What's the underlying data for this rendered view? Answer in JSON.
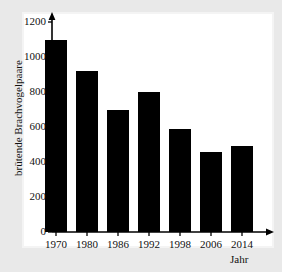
{
  "chart_data": {
    "type": "bar",
    "title": "",
    "subtitle": "",
    "xlabel": "Jahr",
    "ylabel": "brütende Brachvogelpaare",
    "categories": [
      "1970",
      "1980",
      "1986",
      "1992",
      "1998",
      "2006",
      "2014"
    ],
    "values": [
      1100,
      920,
      700,
      800,
      590,
      460,
      490
    ],
    "ylim": [
      0,
      1200
    ],
    "yticks": [
      0,
      200,
      400,
      600,
      800,
      1000,
      1200
    ],
    "ytick_labels": [
      "0",
      "200",
      "400",
      "600",
      "800",
      "1000",
      "1200"
    ],
    "grid": false,
    "legend": false,
    "legend_position": "none",
    "bar_color": "#000000",
    "background_color": "#e9e9e9",
    "panel_color": "#ffffff",
    "axis_color": "#000000",
    "axis_arrows": true
  },
  "axis": {
    "y_title": "brütende Brachvogelpaare",
    "x_title": "Jahr"
  }
}
